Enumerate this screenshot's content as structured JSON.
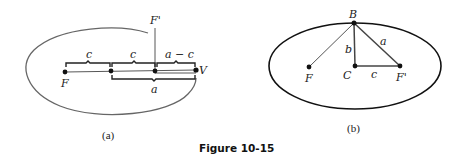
{
  "figure": {
    "caption": "Figure 10-15",
    "panel_a": {
      "label": "(a)",
      "points": {
        "F": "F",
        "F_prime": "F'",
        "V": "V"
      },
      "braces": {
        "top_left": "c",
        "top_middle": "c",
        "top_right": "a − c",
        "bottom": "a"
      }
    },
    "panel_b": {
      "label": "(b)",
      "points": {
        "B": "B",
        "F": "F",
        "C": "C",
        "F_prime": "F'"
      },
      "segments": {
        "BC": "b",
        "BF_prime": "a",
        "CF_prime": "c"
      }
    }
  }
}
